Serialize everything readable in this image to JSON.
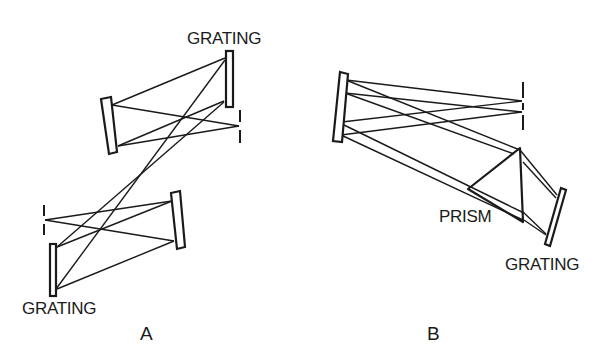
{
  "figure": {
    "panels": [
      {
        "id": "A",
        "caption": "A",
        "labels": {
          "top_grating": "GRATING",
          "bottom_grating": "GRATING"
        },
        "components": [
          "grating",
          "concave-mirror",
          "slit",
          "concave-mirror",
          "slit",
          "grating"
        ]
      },
      {
        "id": "B",
        "caption": "B",
        "labels": {
          "prism": "PRISM",
          "grating": "GRATING"
        },
        "components": [
          "concave-mirror",
          "slit",
          "prism",
          "grating"
        ]
      }
    ],
    "colors": {
      "line": "#1a1a1a",
      "background": "#ffffff"
    }
  }
}
